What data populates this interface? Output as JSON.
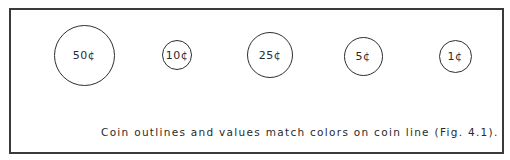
{
  "coins": [
    {
      "label": "50¢",
      "cx": 84,
      "cy": 55,
      "d": 61
    },
    {
      "label": "10¢",
      "cx": 177,
      "cy": 55,
      "d": 30
    },
    {
      "label": "25¢",
      "cx": 270,
      "cy": 55,
      "d": 46
    },
    {
      "label": "5¢",
      "cx": 363,
      "cy": 56,
      "d": 39
    },
    {
      "label": "1¢",
      "cx": 455,
      "cy": 56,
      "d": 33
    }
  ],
  "caption": "Coin outlines and values match colors on coin line (Fig. 4.1)."
}
